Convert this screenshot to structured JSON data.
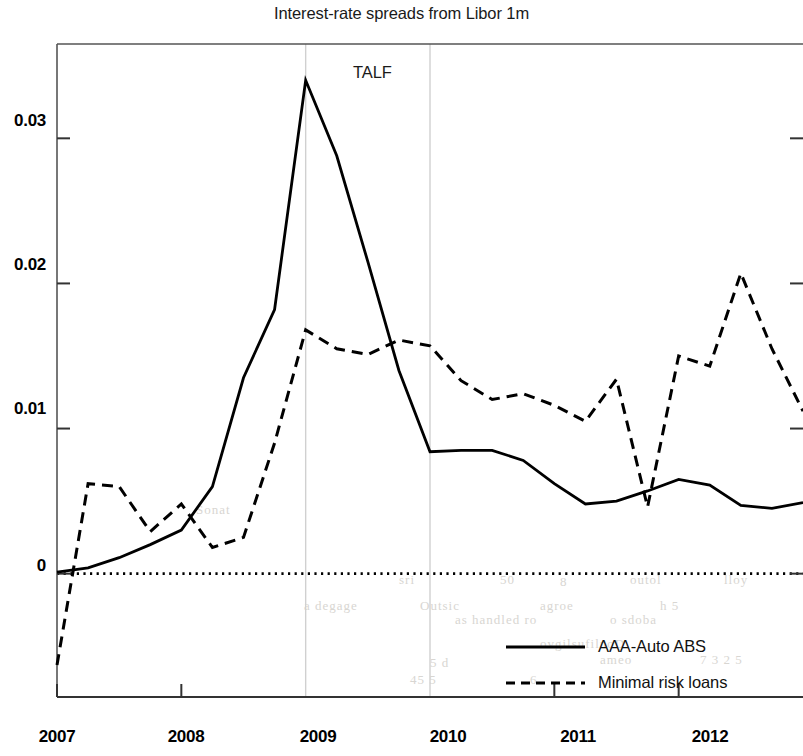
{
  "figure": {
    "title": "Interest-rate spreads from Libor 1m",
    "annotation": "TALF",
    "background_color": "#ffffff",
    "line_color": "#000000",
    "gridline_color": "#d0d0d0"
  },
  "axes": {
    "ytick_labels": [
      "0.03",
      "0.02",
      "0.01",
      "0"
    ],
    "xtick_labels": [
      "2007",
      "2008",
      "2009",
      "2010",
      "2011",
      "2012"
    ]
  },
  "legend": {
    "entries": [
      {
        "label": "AAA-Auto ABS",
        "style": "solid"
      },
      {
        "label": "Minimal risk loans",
        "style": "dashed"
      }
    ]
  },
  "bleed_through": [
    {
      "text": "sri",
      "x": 399,
      "y": 572
    },
    {
      "text": "50",
      "x": 500,
      "y": 572
    },
    {
      "text": "8",
      "x": 560,
      "y": 574
    },
    {
      "text": "outol",
      "x": 630,
      "y": 572
    },
    {
      "text": "lloy",
      "x": 724,
      "y": 572
    },
    {
      "text": "as handled ro",
      "x": 455,
      "y": 612
    },
    {
      "text": "o sdoba",
      "x": 610,
      "y": 612
    },
    {
      "text": "ovgilsufilnoD",
      "x": 540,
      "y": 636
    },
    {
      "text": "5 d",
      "x": 430,
      "y": 655
    },
    {
      "text": "ameo",
      "x": 600,
      "y": 652
    },
    {
      "text": "7 3 2 5",
      "x": 700,
      "y": 652
    },
    {
      "text": "45 5",
      "x": 410,
      "y": 672
    },
    {
      "text": "6",
      "x": 530,
      "y": 672
    },
    {
      "text": "Sonat",
      "x": 196,
      "y": 502
    },
    {
      "text": "a degage",
      "x": 304,
      "y": 598
    },
    {
      "text": "Outsic",
      "x": 420,
      "y": 598
    },
    {
      "text": "agroe",
      "x": 540,
      "y": 598
    },
    {
      "text": "h 5",
      "x": 660,
      "y": 598
    }
  ],
  "chart_data": {
    "type": "line",
    "title": "Interest-rate spreads from Libor 1m",
    "xlabel": "",
    "ylabel": "",
    "xlim": [
      2007.0,
      2013.0
    ],
    "ylim": [
      -0.0085,
      0.0365
    ],
    "yticks": [
      0,
      0.01,
      0.02,
      0.03
    ],
    "xticks": [
      2007,
      2008,
      2009,
      2010,
      2011,
      2012
    ],
    "grid": "vertical gridlines at 2009 and 2010 marking TALF window",
    "legend_position": "lower right",
    "zero_line": true,
    "annotations": [
      {
        "text": "TALF",
        "x": 2009.45,
        "y": 0.0325
      }
    ],
    "series": [
      {
        "name": "AAA-Auto ABS",
        "style": "solid",
        "x": [
          2007.0,
          2007.25,
          2007.5,
          2007.75,
          2008.0,
          2008.25,
          2008.5,
          2008.75,
          2009.0,
          2009.25,
          2009.5,
          2009.75,
          2010.0,
          2010.25,
          2010.5,
          2010.75,
          2011.0,
          2011.25,
          2011.5,
          2011.75,
          2012.0,
          2012.25,
          2012.5,
          2012.75,
          2013.0
        ],
        "y": [
          0.0001,
          0.0004,
          0.0011,
          0.002,
          0.003,
          0.006,
          0.0135,
          0.0182,
          0.034,
          0.0288,
          0.0215,
          0.014,
          0.0084,
          0.0085,
          0.0085,
          0.0078,
          0.0062,
          0.0048,
          0.005,
          0.0057,
          0.0065,
          0.0061,
          0.0047,
          0.0045,
          0.0049
        ]
      },
      {
        "name": "Minimal risk loans",
        "style": "dashed",
        "x": [
          2007.0,
          2007.25,
          2007.5,
          2007.75,
          2008.0,
          2008.25,
          2008.5,
          2008.75,
          2009.0,
          2009.25,
          2009.5,
          2009.75,
          2010.0,
          2010.25,
          2010.5,
          2010.75,
          2011.0,
          2011.25,
          2011.5,
          2011.75,
          2012.0,
          2012.25,
          2012.5,
          2012.75,
          2013.0
        ],
        "y": [
          -0.0063,
          0.0062,
          0.006,
          0.0029,
          0.0048,
          0.0018,
          0.0025,
          0.009,
          0.0168,
          0.0155,
          0.0151,
          0.0161,
          0.0157,
          0.0133,
          0.012,
          0.0124,
          0.0116,
          0.0105,
          0.0134,
          0.0046,
          0.015,
          0.0143,
          0.0207,
          0.0155,
          0.0112
        ]
      }
    ],
    "extra_series_points": {
      "AAA-Auto ABS_late": {
        "x": [
          2012.75,
          2013.0
        ],
        "y": [
          0.0033,
          0.0032
        ]
      }
    }
  }
}
